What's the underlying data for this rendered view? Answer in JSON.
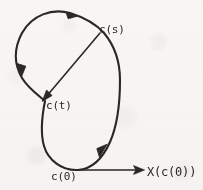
{
  "figure": {
    "kind": "hand-drawn-mathematics-diagram",
    "background_color": "#f7f6f4",
    "ink_color": "#2a2724"
  },
  "labels": {
    "c_of_s": "c(s)",
    "c_of_t": "c(t)",
    "c_of_0": "c(0)",
    "vector_field": "X(c(0))"
  },
  "geometry": {
    "closed_curve": {
      "name": "integral-curve",
      "orientation": "counterclockwise",
      "path": "M 78 170 C 62 171 48 160 44 146 C 40 132 42 116 45 101 C 38 95 28 88 22 78 C 14 64 14 48 22 33 C 32 15 52 8 70 13 C 86 18 96 24 104 33 C 114 45 120 60 120 80 C 120 102 118 124 110 142 C 102 160 92 169 78 170 Z"
    },
    "direction_arrowheads": [
      {
        "name": "arrowhead-top",
        "x": 72,
        "y": 14,
        "angle_deg": 198
      },
      {
        "name": "arrowhead-left",
        "x": 21,
        "y": 73,
        "angle_deg": 100
      },
      {
        "name": "arrowhead-lower-right",
        "x": 104,
        "y": 148,
        "angle_deg": 290
      }
    ],
    "chord_arrow": {
      "name": "chord-cs-to-ct",
      "from": {
        "x": 100,
        "y": 33
      },
      "to": {
        "x": 43,
        "y": 100
      }
    },
    "vector_arrow": {
      "name": "tangent-vector-arrow",
      "from": {
        "x": 78,
        "y": 170
      },
      "to": {
        "x": 144,
        "y": 170
      }
    },
    "marked_points": [
      {
        "name": "point-c0",
        "x": 78,
        "y": 170
      },
      {
        "name": "point-cs",
        "x": 100,
        "y": 33
      },
      {
        "name": "point-ct",
        "x": 43,
        "y": 100
      }
    ]
  }
}
